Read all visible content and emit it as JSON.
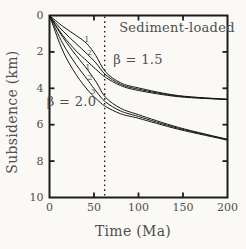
{
  "figure": {
    "region_label": "Sediment-loaded",
    "beta_label_upper": "β = 1.5",
    "beta_label_lower": "β = 2.0",
    "xlabel": "Time (Ma)",
    "ylabel": "Subsidence (km)"
  },
  "chart_data": {
    "type": "line",
    "title": "Sediment-loaded",
    "xlabel": "Time (Ma)",
    "ylabel": "Subsidence (km)",
    "xlim": [
      0,
      200
    ],
    "ylim": [
      0,
      10
    ],
    "y_axis_inverted": true,
    "x_ticks": [
      0,
      50,
      100,
      150,
      200
    ],
    "y_ticks": [
      0,
      2,
      4,
      6,
      8,
      10
    ],
    "grid": false,
    "legend_position": "none",
    "frame": "full box with inward ticks on all four sides",
    "line_color": "#161616",
    "label_color": "#4f4f4f",
    "annotations": {
      "vline": {
        "x": 62,
        "style": "dotted"
      },
      "beta_labels": [
        {
          "text": "β = 1.5",
          "x": 98,
          "y": 2.6
        },
        {
          "text": "β = 2.0",
          "x": 25,
          "y": 5.0
        }
      ],
      "curve_numbers": [
        {
          "text": "1",
          "x": 42,
          "y": 1.3,
          "family": "beta-1.5"
        },
        {
          "text": "2",
          "x": 45,
          "y": 2.05,
          "family": "beta-1.5"
        },
        {
          "text": "1",
          "x": 43,
          "y": 2.85,
          "family": "beta-2.0"
        },
        {
          "text": "2",
          "x": 45.5,
          "y": 3.4,
          "family": "beta-2.0"
        },
        {
          "text": "3",
          "x": 49,
          "y": 4.15,
          "family": "beta-2.0"
        }
      ]
    },
    "series": [
      {
        "name": "beta-1.5 curve 1",
        "beta": 1.5,
        "curve": "1",
        "x": [
          0,
          15,
          30,
          42,
          52,
          63,
          80,
          100,
          145,
          200
        ],
        "y": [
          0,
          0.6,
          1.1,
          1.55,
          2.2,
          3.1,
          3.7,
          3.98,
          4.4,
          4.6
        ]
      },
      {
        "name": "beta-1.5 curve 2",
        "beta": 1.5,
        "curve": "2",
        "x": [
          0,
          15,
          30,
          42,
          52,
          63,
          80,
          100,
          145,
          200
        ],
        "y": [
          0,
          0.85,
          1.55,
          2.1,
          2.6,
          3.25,
          3.78,
          4.05,
          4.43,
          4.61
        ]
      },
      {
        "name": "beta-1.5 curve 3",
        "beta": 1.5,
        "curve": "3",
        "x": [
          0,
          15,
          30,
          42,
          52,
          63,
          80,
          100,
          145,
          200
        ],
        "y": [
          0,
          1.1,
          1.95,
          2.5,
          2.95,
          3.4,
          3.85,
          4.12,
          4.46,
          4.62
        ]
      },
      {
        "name": "beta-2.0 curve 1",
        "beta": 2.0,
        "curve": "1",
        "x": [
          0,
          15,
          30,
          43,
          53,
          63,
          80,
          100,
          145,
          200
        ],
        "y": [
          0,
          1.2,
          2.2,
          3.0,
          3.7,
          4.5,
          5.1,
          5.45,
          6.15,
          6.8
        ]
      },
      {
        "name": "beta-2.0 curve 2",
        "beta": 2.0,
        "curve": "2",
        "x": [
          0,
          15,
          30,
          43,
          53,
          63,
          80,
          100,
          145,
          200
        ],
        "y": [
          0,
          1.55,
          2.7,
          3.55,
          4.2,
          4.75,
          5.25,
          5.55,
          6.2,
          6.82
        ]
      },
      {
        "name": "beta-2.0 curve 3",
        "beta": 2.0,
        "curve": "3",
        "x": [
          0,
          15,
          30,
          43,
          53,
          63,
          80,
          100,
          145,
          200
        ],
        "y": [
          0,
          1.95,
          3.25,
          4.1,
          4.6,
          5.0,
          5.4,
          5.65,
          6.25,
          6.85
        ]
      }
    ]
  }
}
